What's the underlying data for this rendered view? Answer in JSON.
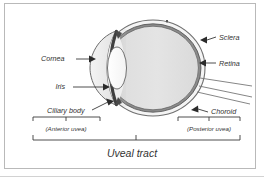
{
  "figure": {
    "title": "Uveal tract",
    "frame_color": "#b9b9b9",
    "ink_color": "#333333",
    "background": "#ffffff"
  },
  "labels": {
    "cornea": "Cornea",
    "iris": "Iris",
    "ciliary_body": "Ciliary body",
    "sclera": "Sclera",
    "retina": "Retina",
    "choroid": "Choroid",
    "anterior_uvea": "(Anterior uvea)",
    "posterior_uvea": "(Posterior uvea)"
  },
  "anatomy": {
    "parts": [
      {
        "name": "sclera",
        "label": "Sclera",
        "side": "right",
        "fill": "#f2f2f2"
      },
      {
        "name": "retina",
        "label": "Retina",
        "side": "right",
        "fill": "#7d7d7d"
      },
      {
        "name": "choroid",
        "label": "Choroid",
        "side": "right",
        "fill": "#8a8a8a"
      },
      {
        "name": "cornea",
        "label": "Cornea",
        "side": "left",
        "fill": "#ececec"
      },
      {
        "name": "iris",
        "label": "Iris",
        "side": "left",
        "fill": "#5a5a5a"
      },
      {
        "name": "ciliary-body",
        "label": "Ciliary body",
        "side": "left",
        "fill": "#5a5a5a"
      },
      {
        "name": "lens",
        "label": "",
        "side": "left",
        "fill": "#fdfdfd"
      },
      {
        "name": "vitreous",
        "label": "",
        "side": "center",
        "fill": "#e3e3e3"
      }
    ]
  },
  "brackets": [
    {
      "name": "anterior-uvea-bracket",
      "label": "(Anterior uvea)"
    },
    {
      "name": "posterior-uvea-bracket",
      "label": "(Posterior uvea)"
    },
    {
      "name": "uveal-tract-bracket",
      "label": "Uveal tract"
    }
  ]
}
